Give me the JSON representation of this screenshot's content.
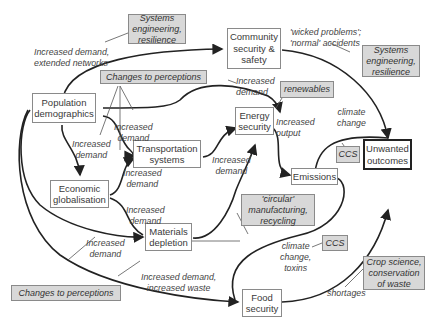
{
  "colors": {
    "background": "#ffffff",
    "node_fill": "#ffffff",
    "tag_fill": "#d8d8d8",
    "line": "#222222",
    "border": "#8a8a8a"
  },
  "nodes": {
    "population": "Population\ndemographics",
    "community": "Community\nsecurity &\nsafety",
    "energy": "Energy\nsecurity",
    "transport": "Transportation\nsystems",
    "economic": "Economic\nglobalisation",
    "materials": "Materials\ndepletion",
    "emissions": "Emissions",
    "unwanted": "Unwanted\noutcomes",
    "food": "Food\nsecurity"
  },
  "interventions": {
    "systems_eng_top": "Systems\nengineering,\nresilience",
    "systems_eng_right": "Systems\nengineering,\nresilience",
    "perceptions_top": "Changes to perceptions",
    "perceptions_bottom": "Changes to perceptions",
    "renewables": "renewables",
    "ccs_upper": "CCS",
    "ccs_lower": "CCS",
    "circular": "'circular'\nmanufacturing,\nrecycling",
    "crop_science": "Crop science,\nconservation\nof waste"
  },
  "edge_labels": {
    "extended_networks": "Increased demand,\nextended networks",
    "wicked": "'wicked problems';\n'normal' accidents",
    "demand_energy_top": "Increased\ndemand",
    "demand_pop_econ": "Increased\ndemand",
    "demand_pop_transport": "Increased\ndemand",
    "demand_econ_transport": "Increased\ndemand",
    "increased_output": "Increased\noutput",
    "demand_materials_energy": "Increased\ndemand",
    "climate_change_upper": "climate\nchange",
    "demand_econ_materials": "Increased\ndemand",
    "demand_pop_materials": "Increased\ndemand",
    "demand_waste": "Increased demand,\nincreased waste",
    "climate_toxins": "climate\nchange,\ntoxins",
    "shortages": "shortages"
  }
}
